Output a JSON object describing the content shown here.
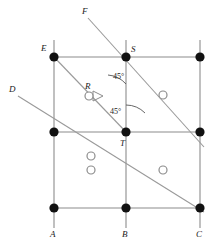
{
  "figure": {
    "background_color": "#ffffff",
    "grid_line_color": "#8c8c8c",
    "diagonal_line_color": "#9a9a9a",
    "filled_node_color": "#111111",
    "open_node_stroke": "#8c8c8c",
    "text_color": "#1a1a1a"
  },
  "grid": {
    "columns_x": [
      54,
      126,
      200
    ],
    "rows_y": [
      57,
      132,
      208
    ],
    "stub_top_y": 40,
    "stub_bottom_y": 228
  },
  "filled_nodes": [
    {
      "name": "node-E",
      "x": 54,
      "y": 57
    },
    {
      "name": "node-S",
      "x": 126,
      "y": 57
    },
    {
      "name": "node-top-right",
      "x": 200,
      "y": 57
    },
    {
      "name": "node-mid-left",
      "x": 54,
      "y": 132
    },
    {
      "name": "node-T",
      "x": 126,
      "y": 132
    },
    {
      "name": "node-mid-right",
      "x": 200,
      "y": 132
    },
    {
      "name": "node-A",
      "x": 54,
      "y": 208
    },
    {
      "name": "node-B",
      "x": 126,
      "y": 208
    },
    {
      "name": "node-C",
      "x": 200,
      "y": 208
    }
  ],
  "open_nodes": [
    {
      "name": "open-node-R",
      "x": 89,
      "y": 96,
      "r": 4
    },
    {
      "name": "open-node-upper-right",
      "x": 163,
      "y": 95,
      "r": 4
    },
    {
      "name": "open-node-lower-left-a",
      "x": 91,
      "y": 156,
      "r": 4
    },
    {
      "name": "open-node-lower-left-b",
      "x": 91,
      "y": 170,
      "r": 4
    },
    {
      "name": "open-node-lower-right",
      "x": 163,
      "y": 170,
      "r": 4
    }
  ],
  "diagonals": [
    {
      "name": "diagonal-D-to-C",
      "x1": 18,
      "y1": 96,
      "x2": 204,
      "y2": 212
    },
    {
      "name": "diagonal-F-to-lower-right",
      "x1": 88,
      "y1": 18,
      "x2": 204,
      "y2": 147
    },
    {
      "name": "diagonal-E-to-T",
      "x1": 54,
      "y1": 57,
      "x2": 126,
      "y2": 132
    }
  ],
  "labels": [
    {
      "name": "label-F",
      "text": "F",
      "x": 82,
      "y": 7
    },
    {
      "name": "label-E",
      "text": "E",
      "x": 41,
      "y": 44
    },
    {
      "name": "label-S",
      "text": "S",
      "x": 131,
      "y": 45
    },
    {
      "name": "label-D",
      "text": "D",
      "x": 9,
      "y": 85
    },
    {
      "name": "label-R",
      "text": "R",
      "x": 85,
      "y": 82
    },
    {
      "name": "label-T",
      "text": "T",
      "x": 120,
      "y": 139
    },
    {
      "name": "label-A",
      "text": "A",
      "x": 50,
      "y": 230
    },
    {
      "name": "label-B",
      "text": "B",
      "x": 122,
      "y": 230
    },
    {
      "name": "label-C",
      "text": "C",
      "x": 196,
      "y": 230
    }
  ],
  "angles": [
    {
      "name": "angle-upper-45",
      "text": "45°",
      "label_x": 113,
      "label_y": 73,
      "vertex_x": 126,
      "vertex_y": 57,
      "arc_r": 27
    },
    {
      "name": "angle-lower-45",
      "text": "45°",
      "label_x": 110,
      "label_y": 108,
      "vertex_x": 126,
      "vertex_y": 132,
      "arc_r": 27
    }
  ],
  "right_angle_marker": {
    "name": "right-angle-marker-at-R",
    "points": "93,91 103,96 93,101"
  }
}
